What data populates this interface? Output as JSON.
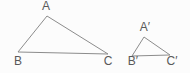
{
  "figure": {
    "background_color": "#fcfcfc",
    "line_color": "#8c8c8c",
    "text_color": "#595959",
    "triangles": [
      {
        "id": "ABC",
        "points": "47,16 18,52 108,54",
        "labels": {
          "a": "A",
          "b": "B",
          "c": "C"
        }
      },
      {
        "id": "A'B'C'",
        "points": "144,37 132,56 170,55",
        "labels": {
          "a": "A′",
          "b": "B′",
          "c": "C′"
        }
      }
    ]
  }
}
